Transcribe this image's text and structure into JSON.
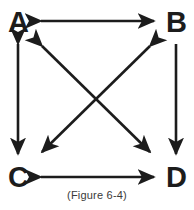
{
  "figure": {
    "caption": "(Figure 6-4)",
    "stroke_color": "#1c1c1c",
    "background_color": "#ffffff",
    "label_color": "#1c1c1c",
    "caption_color": "#3a3a3a",
    "nodes": [
      {
        "id": "A",
        "label": "A",
        "position": "top-left"
      },
      {
        "id": "B",
        "label": "B",
        "position": "top-right"
      },
      {
        "id": "C",
        "label": "C",
        "position": "bottom-left"
      },
      {
        "id": "D",
        "label": "D",
        "position": "bottom-right"
      }
    ],
    "arrows": [
      {
        "id": "ab",
        "from": "A",
        "to": "B",
        "orientation": "horizontal",
        "heads": "double"
      },
      {
        "id": "cd",
        "from": "C",
        "to": "D",
        "orientation": "horizontal",
        "heads": "double"
      },
      {
        "id": "ac",
        "from": "A",
        "to": "C",
        "orientation": "vertical",
        "heads": "double"
      },
      {
        "id": "bd",
        "from": "B",
        "to": "D",
        "orientation": "vertical",
        "heads": "single-down"
      },
      {
        "id": "ad",
        "from": "A",
        "to": "D",
        "orientation": "diagonal-down-right",
        "heads": "double"
      },
      {
        "id": "bc",
        "from": "B",
        "to": "C",
        "orientation": "diagonal-down-left",
        "heads": "double"
      }
    ]
  }
}
